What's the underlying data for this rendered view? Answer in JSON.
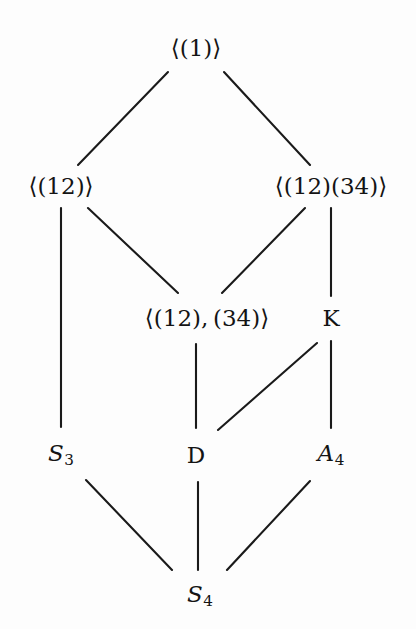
{
  "diagram": {
    "type": "hasse-lattice",
    "background_color": "#fdfdfd",
    "line_color": "#1a1a1a",
    "text_color": "#141414",
    "nodes": [
      {
        "id": "top",
        "label": "⟨(1)⟩",
        "plain": "<(1)>",
        "x": 196,
        "y": 48,
        "level": 0
      },
      {
        "id": "c12",
        "label": "⟨(12)⟩",
        "plain": "<(12)>",
        "x": 61,
        "y": 186,
        "level": 1
      },
      {
        "id": "c1234",
        "label": "⟨(12)(34)⟩",
        "plain": "<(12)(34)>",
        "x": 331,
        "y": 186,
        "level": 1
      },
      {
        "id": "v4",
        "label": "⟨(12), (34)⟩",
        "plain": "<(12),(34)>",
        "x": 207,
        "y": 318,
        "level": 2
      },
      {
        "id": "k",
        "label": "K",
        "plain": "K",
        "x": 331,
        "y": 318,
        "level": 2
      },
      {
        "id": "s3",
        "label": "S₃",
        "plain": "S_3",
        "x": 61,
        "y": 455,
        "level": 3
      },
      {
        "id": "d",
        "label": "D",
        "plain": "D",
        "x": 196,
        "y": 455,
        "level": 3
      },
      {
        "id": "a4",
        "label": "A₄",
        "plain": "A_4",
        "x": 331,
        "y": 455,
        "level": 3
      },
      {
        "id": "s4",
        "label": "S₄",
        "plain": "S_4",
        "x": 200,
        "y": 596,
        "level": 4
      }
    ],
    "edges": [
      {
        "id": "top-c12",
        "from": "top",
        "to": "c12",
        "x1": 168,
        "y1": 72,
        "x2": 78,
        "y2": 165
      },
      {
        "id": "top-c1234",
        "from": "top",
        "to": "c1234",
        "x1": 224,
        "y1": 72,
        "x2": 310,
        "y2": 165
      },
      {
        "id": "c12-s3",
        "from": "c12",
        "to": "s3",
        "x1": 61,
        "y1": 208,
        "x2": 61,
        "y2": 427
      },
      {
        "id": "c12-v4",
        "from": "c12",
        "to": "v4",
        "x1": 88,
        "y1": 208,
        "x2": 178,
        "y2": 293
      },
      {
        "id": "c1234-v4",
        "from": "c1234",
        "to": "v4",
        "x1": 305,
        "y1": 208,
        "x2": 222,
        "y2": 293
      },
      {
        "id": "c1234-k",
        "from": "c1234",
        "to": "k",
        "x1": 331,
        "y1": 208,
        "x2": 331,
        "y2": 296
      },
      {
        "id": "v4-d",
        "from": "v4",
        "to": "d",
        "x1": 196,
        "y1": 344,
        "x2": 196,
        "y2": 428
      },
      {
        "id": "k-d",
        "from": "k",
        "to": "d",
        "x1": 317,
        "y1": 343,
        "x2": 218,
        "y2": 430
      },
      {
        "id": "k-a4",
        "from": "k",
        "to": "a4",
        "x1": 331,
        "y1": 341,
        "x2": 331,
        "y2": 428
      },
      {
        "id": "s3-s4",
        "from": "s3",
        "to": "s4",
        "x1": 86,
        "y1": 480,
        "x2": 172,
        "y2": 570
      },
      {
        "id": "d-s4",
        "from": "d",
        "to": "s4",
        "x1": 198,
        "y1": 482,
        "x2": 198,
        "y2": 570
      },
      {
        "id": "a4-s4",
        "from": "a4",
        "to": "s4",
        "x1": 310,
        "y1": 481,
        "x2": 227,
        "y2": 570
      }
    ]
  }
}
